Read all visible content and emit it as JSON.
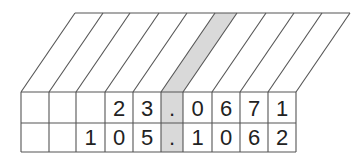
{
  "diagram": {
    "title": "",
    "rows": [
      [
        "",
        "",
        "",
        "2",
        "3",
        ".",
        "0",
        "6",
        "7",
        "1"
      ],
      [
        "",
        "",
        "1",
        "0",
        "5",
        ".",
        "1",
        "0",
        "6",
        "2"
      ]
    ],
    "decimal_column_index": 5,
    "colors": {
      "line": "#555555",
      "highlight": "#d9d9d9",
      "text": "#222222"
    }
  }
}
